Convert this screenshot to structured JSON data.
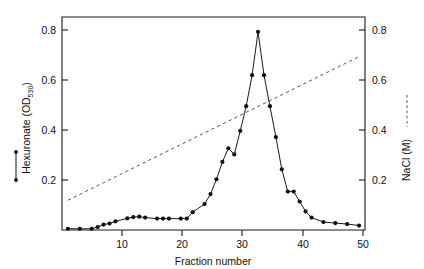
{
  "chart_data": {
    "type": "line",
    "title": "",
    "xlabel": "Fraction number",
    "ylabel_left": "Hexuronate (OD",
    "ylabel_left_sub": "530",
    "ylabel_left_close": ")",
    "ylabel_right": "NaCl (M)",
    "xlim": [
      0,
      51
    ],
    "ylim_left": [
      0,
      0.86
    ],
    "ylim_right": [
      0,
      0.86
    ],
    "grid": false,
    "legend_position": "outside-left-and-right",
    "x_ticks": [
      10,
      20,
      30,
      40,
      50
    ],
    "x_tick_labels": [
      "10",
      "20",
      "30",
      "40",
      "50"
    ],
    "y_ticks_left": [
      0.2,
      0.4,
      0.6,
      0.8
    ],
    "y_tick_labels_left": [
      "0.2",
      "0.4",
      "0.6",
      "0.8"
    ],
    "y_ticks_right": [
      0.2,
      0.4,
      0.6,
      0.8
    ],
    "y_tick_labels_right": [
      "0.2",
      "0.4",
      "0.6",
      "0.8"
    ],
    "series": [
      {
        "name": "Hexuronate (OD530)",
        "style": "solid-with-markers",
        "color": "#111111",
        "x": [
          1,
          3,
          5,
          6,
          7,
          8,
          9,
          11,
          12,
          13,
          14,
          16,
          17,
          18,
          20,
          21,
          22,
          24,
          25,
          26,
          27,
          28,
          29,
          30,
          31,
          32,
          33,
          34,
          35,
          36,
          37,
          38,
          39,
          40,
          41,
          42,
          44,
          46,
          48,
          50
        ],
        "y": [
          0.005,
          0.005,
          0.005,
          0.012,
          0.022,
          0.026,
          0.035,
          0.047,
          0.052,
          0.054,
          0.05,
          0.046,
          0.046,
          0.046,
          0.046,
          0.046,
          0.072,
          0.105,
          0.145,
          0.205,
          0.275,
          0.33,
          0.305,
          0.4,
          0.5,
          0.625,
          0.8,
          0.625,
          0.5,
          0.375,
          0.245,
          0.155,
          0.155,
          0.115,
          0.075,
          0.05,
          0.032,
          0.028,
          0.024,
          0.018
        ]
      },
      {
        "name": "NaCl (M)",
        "style": "dashed",
        "color": "#555555",
        "x": [
          1,
          50
        ],
        "y": [
          0.12,
          0.7
        ]
      }
    ]
  },
  "legend": {
    "left_label_main": "Hexuronate (OD",
    "left_label_sub": "530",
    "left_label_tail": ")",
    "right_label": "NaCl (M)"
  },
  "colors": {
    "axis": "#1a1a1a",
    "data": "#111111",
    "dashed": "#555555",
    "background": "#ffffff"
  }
}
